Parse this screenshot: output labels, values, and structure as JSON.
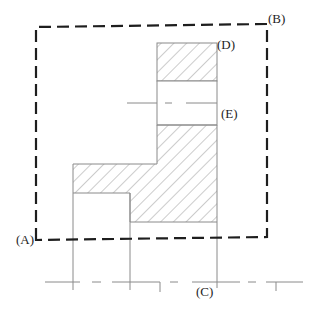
{
  "diagram": {
    "type": "mechanical-section-drawing",
    "labels": {
      "A": "(A)",
      "B": "(B)",
      "C": "(C)",
      "D": "(D)",
      "E": "(E)"
    },
    "colors": {
      "line": "#1e1e1e",
      "thin_line": "#8a8a8a",
      "hatch": "#9a9a9a",
      "background": "#ffffff"
    }
  }
}
